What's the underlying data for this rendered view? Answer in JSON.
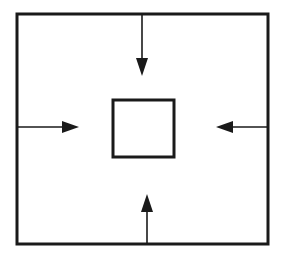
{
  "diagram": {
    "colors": {
      "stroke": "#1a1a1a",
      "background": "#ffffff"
    },
    "outer_box": {
      "x": 17,
      "y": 14,
      "width": 251,
      "height": 230,
      "stroke_width": 3
    },
    "inner_box": {
      "x": 113,
      "y": 100,
      "width": 61,
      "height": 57,
      "stroke_width": 3
    },
    "arrows": [
      {
        "name": "top",
        "direction": "down",
        "from": [
          142,
          14
        ],
        "to": [
          142,
          75
        ]
      },
      {
        "name": "bottom",
        "direction": "up",
        "from": [
          147,
          244
        ],
        "to": [
          147,
          195
        ]
      },
      {
        "name": "left",
        "direction": "right",
        "from": [
          17,
          127
        ],
        "to": [
          79,
          127
        ]
      },
      {
        "name": "right",
        "direction": "left",
        "from": [
          268,
          127
        ],
        "to": [
          216,
          127
        ]
      }
    ]
  }
}
